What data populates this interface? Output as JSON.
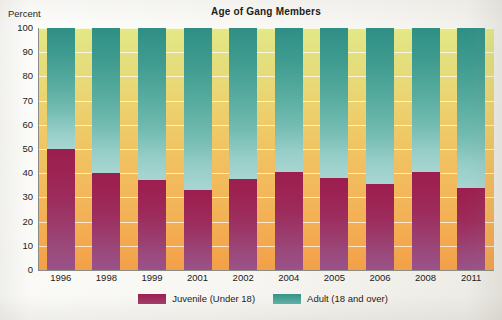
{
  "chart_data": {
    "type": "bar",
    "title": "Age of Gang Members",
    "subtitle": "",
    "stacked": true,
    "stacked_total": 100,
    "xlabel": "",
    "ylabel": "Percent",
    "ylim": [
      0,
      100
    ],
    "yticks": [
      0,
      10,
      20,
      30,
      40,
      50,
      60,
      70,
      80,
      90,
      100
    ],
    "ytick_labels": [
      "0",
      "10",
      "20",
      "30",
      "40",
      "50",
      "60",
      "70",
      "80",
      "90",
      "100"
    ],
    "grid": true,
    "legend_position": "bottom",
    "categories": [
      "1996",
      "1998",
      "1999",
      "2001",
      "2002",
      "2004",
      "2005",
      "2006",
      "2008",
      "2011"
    ],
    "series": [
      {
        "name": "Juvenile (Under 18)",
        "color": "#9c1f50",
        "values": [
          50,
          40,
          37,
          33,
          37.5,
          40.5,
          38,
          35.5,
          40.5,
          34
        ]
      },
      {
        "name": "Adult (18 and over)",
        "color": "#339486",
        "values": [
          50,
          60,
          63,
          67,
          62.5,
          59.5,
          62,
          64.5,
          59.5,
          66
        ]
      }
    ],
    "annotations": []
  },
  "labels": {
    "title": "Age of Gang Members",
    "ylabel": "Percent"
  },
  "legend": {
    "items": [
      {
        "label": "Juvenile (Under 18)",
        "swatch": "juvenile-swatch"
      },
      {
        "label": "Adult (18 and over)",
        "swatch": "adult-swatch"
      }
    ]
  },
  "colors": {
    "juvenile": "#9c1f50",
    "adult": "#339486",
    "background_top": "#e4e887",
    "background_bottom": "#f2a049",
    "axis": "#8c8c86",
    "gridline": "#ffffff"
  }
}
